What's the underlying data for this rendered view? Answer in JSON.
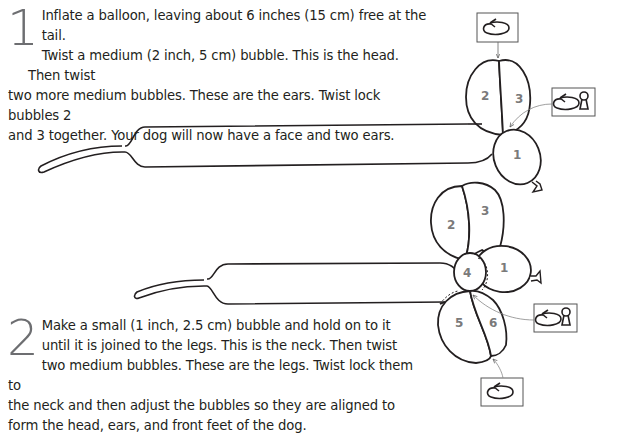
{
  "steps": [
    {
      "number": "1",
      "lines": [
        "Inflate a balloon, leaving about 6 inches (15 cm) free at the tail.",
        "Twist a medium (2 inch, 5 cm) bubble. This is the head. Then twist",
        "two more medium bubbles. These are the ears. Twist lock bubbles 2",
        "and 3 together. Your dog will now have a face and two ears."
      ]
    },
    {
      "number": "2",
      "lines": [
        "Make a small (1 inch, 2.5 cm) bubble and hold on to it",
        "until it is joined to the legs. This is the neck. Then twist",
        "two medium bubbles. These are the legs. Twist lock them to",
        "the neck and then adjust the bubbles so they are aligned to",
        "form the head, ears, and front feet of the dog."
      ]
    }
  ],
  "diagram1": {
    "bubbles": [
      {
        "label": "1",
        "role": "head"
      },
      {
        "label": "2",
        "role": "ear"
      },
      {
        "label": "3",
        "role": "ear"
      }
    ],
    "icons": [
      "twist-icon",
      "twist-lock-icon"
    ]
  },
  "diagram2": {
    "bubbles": [
      {
        "label": "1",
        "role": "head"
      },
      {
        "label": "2",
        "role": "ear"
      },
      {
        "label": "3",
        "role": "ear"
      },
      {
        "label": "4",
        "role": "neck"
      },
      {
        "label": "5",
        "role": "leg"
      },
      {
        "label": "6",
        "role": "leg"
      }
    ],
    "icons": [
      "twist-lock-icon",
      "twist-icon"
    ]
  },
  "colors": {
    "ink": "#231f20",
    "label_gray": "#7a7a7a",
    "step_number_gray": "#6d6e71",
    "arrow_gray": "#888888"
  }
}
